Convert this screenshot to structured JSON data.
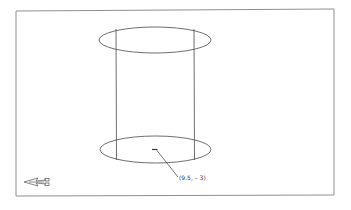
{
  "viewport": {
    "frame": {
      "x1": 16,
      "y1": 10,
      "x2": 334,
      "y2": 196,
      "stroke": "#8a8a8a"
    }
  },
  "drawing": {
    "stroke": "#4a4a4a",
    "cylinder": {
      "top_ellipse": {
        "cx": 155,
        "cy": 40,
        "rx": 56,
        "ry": 13
      },
      "bottom_ellipse": {
        "cx": 155,
        "cy": 149.5,
        "rx": 56,
        "ry": 13.5
      },
      "left_edge_x": 116,
      "right_edge_x": 194
    },
    "center_point": {
      "x": 155,
      "y": 150
    },
    "leader": {
      "x1": 157,
      "y1": 151,
      "x2": 178,
      "y2": 177
    }
  },
  "annotation": {
    "coordinate_label": "(9.5, – 3)"
  },
  "ucs_icon": {
    "name": "ucs-icon",
    "x": 24,
    "y": 180
  }
}
